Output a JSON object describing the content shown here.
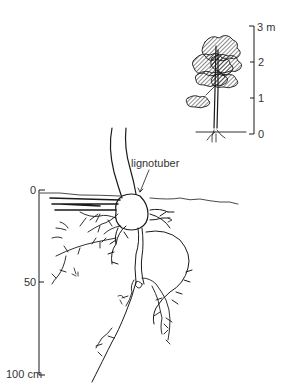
{
  "figure": {
    "type": "botanical-diagram"
  },
  "tree_inset": {
    "height_scale": {
      "unit": "m",
      "ticks": [
        {
          "label": "3 m",
          "value": 3
        },
        {
          "label": "2",
          "value": 2
        },
        {
          "label": "1",
          "value": 1
        },
        {
          "label": "0",
          "value": 0
        }
      ]
    }
  },
  "root_diagram": {
    "annotation": "lignotuber",
    "depth_scale": {
      "unit": "cm",
      "ticks": [
        {
          "label": "0",
          "value": 0
        },
        {
          "label": "50",
          "value": 50
        },
        {
          "label": "100 cm",
          "value": 100
        }
      ]
    }
  },
  "colors": {
    "ink": "#1a1a1a",
    "background": "#ffffff",
    "label": "#333333"
  }
}
